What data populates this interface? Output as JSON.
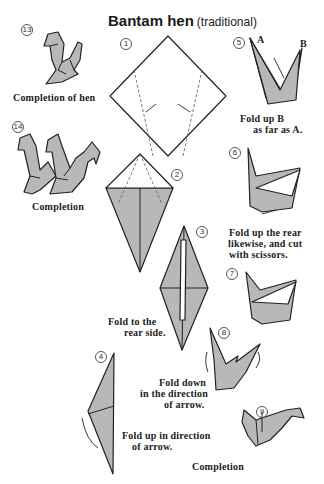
{
  "title": {
    "main": "Bantam hen",
    "sub": "(traditional)"
  },
  "steps": [
    {
      "num": "13",
      "caption": "Completion of hen"
    },
    {
      "num": "14",
      "caption": "Completion"
    },
    {
      "num": "1",
      "caption": ""
    },
    {
      "num": "2",
      "caption": ""
    },
    {
      "num": "3",
      "caption_lines": [
        "Fold to the",
        "rear side."
      ]
    },
    {
      "num": "4",
      "caption_lines": [
        "Fold up in direction",
        "of arrow."
      ]
    },
    {
      "num": "5",
      "labels": {
        "a": "A",
        "b": "B"
      },
      "caption_lines": [
        "Fold up B",
        "as far as A."
      ]
    },
    {
      "num": "6",
      "caption_lines": [
        "Fold up the rear",
        "likewise, and cut",
        "with scissors."
      ]
    },
    {
      "num": "7",
      "caption": ""
    },
    {
      "num": "8",
      "caption_lines": [
        "Fold down",
        "in the direction",
        "of arrow."
      ]
    },
    {
      "num": "9",
      "caption": "Completion"
    }
  ],
  "colors": {
    "paper_shade": "#b8b8b8",
    "line": "#222222",
    "background": "#ffffff"
  }
}
